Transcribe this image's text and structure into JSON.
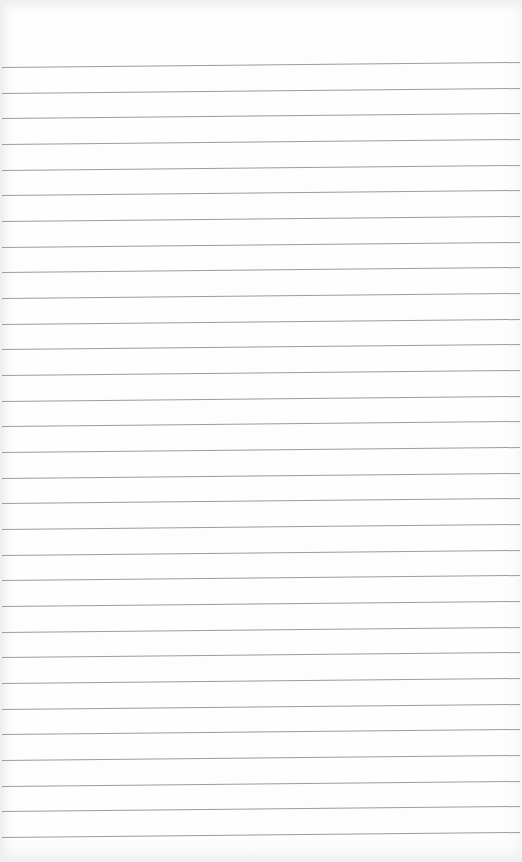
{
  "sheet": {
    "type": "ruled-paper",
    "background_color": "#fdfdfd",
    "line_color": "#9c9c9c",
    "line_count": 31,
    "first_line_y": 67,
    "line_spacing": 25.67
  }
}
